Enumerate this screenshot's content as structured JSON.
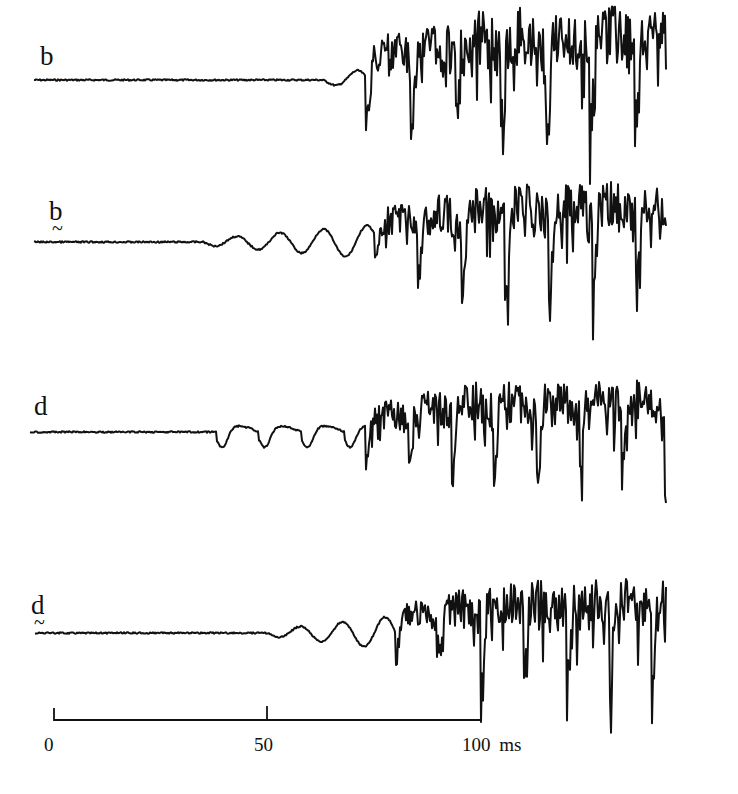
{
  "chart_data": {
    "type": "line",
    "title": "",
    "xlabel": "ms",
    "x_unit": "ms",
    "xlim": [
      0,
      150
    ],
    "scale_bar": {
      "ticks": [
        0,
        50,
        100
      ],
      "tick_labels": [
        "0",
        "50",
        "100"
      ],
      "unit": "ms"
    },
    "series": [
      {
        "name": "b",
        "label": "b",
        "diacritic": "",
        "baseline_y": 80,
        "onset_ms": 63,
        "prevoicing": "small irregular ripple 63–73 ms",
        "voicing_start_ms": 73,
        "period_ms": 10.5,
        "max_down": 85,
        "max_up": 55
      },
      {
        "name": "b̰",
        "label": "b",
        "diacritic": "~",
        "baseline_y": 242,
        "onset_ms": 35,
        "prevoicing": "growing oscillation 35–75 ms",
        "voicing_start_ms": 75,
        "period_ms": 10.2,
        "max_down": 85,
        "max_up": 45
      },
      {
        "name": "d",
        "label": "d",
        "diacritic": "",
        "baseline_y": 432,
        "onset_ms": 38,
        "prevoicing": "regular dips with ~10 ms period 38–73 ms",
        "voicing_start_ms": 73,
        "period_ms": 10.0,
        "max_down": 70,
        "max_up": 40
      },
      {
        "name": "d̰",
        "label": "d",
        "diacritic": "~",
        "baseline_y": 633,
        "onset_ms": 50,
        "prevoicing": "growing oscillation 50–80 ms",
        "voicing_start_ms": 80,
        "period_ms": 10.0,
        "max_down": 85,
        "max_up": 42
      }
    ]
  },
  "labels": {
    "trace_b": "b",
    "trace_b_creaky": "b",
    "trace_d": "d",
    "trace_d_creaky": "d",
    "tilde": "~",
    "tick_0": "0",
    "tick_50": "50",
    "tick_100": "100 ms"
  }
}
